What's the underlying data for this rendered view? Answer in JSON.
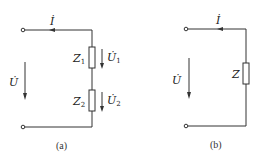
{
  "figure": {
    "stroke_color": "#333333",
    "background": "#ffffff"
  },
  "circuit_a": {
    "caption": "(a)",
    "current_label": "İ",
    "voltage_label": "U̇",
    "impedances": [
      {
        "name": "Z",
        "subscript": "1",
        "voltage_name": "U̇",
        "voltage_subscript": "1"
      },
      {
        "name": "Z",
        "subscript": "2",
        "voltage_name": "U̇",
        "voltage_subscript": "2"
      }
    ]
  },
  "circuit_b": {
    "caption": "(b)",
    "current_label": "İ",
    "voltage_label": "U̇",
    "impedance": {
      "name": "Z"
    }
  }
}
